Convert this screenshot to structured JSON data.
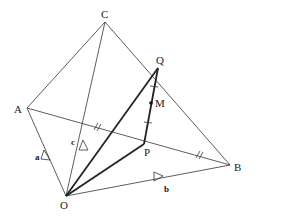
{
  "diagram": {
    "type": "vector geometry tetrahedron",
    "points": {
      "O": {
        "label": "O",
        "x": 66,
        "y": 196
      },
      "A": {
        "label": "A",
        "x": 27,
        "y": 108
      },
      "B": {
        "label": "B",
        "x": 230,
        "y": 165
      },
      "C": {
        "label": "C",
        "x": 105,
        "y": 22
      },
      "P": {
        "label": "P",
        "x": 144,
        "y": 144
      },
      "Q": {
        "label": "Q",
        "x": 158,
        "y": 68
      },
      "M": {
        "label": "M",
        "x": 151,
        "y": 103
      }
    },
    "vectors": {
      "a": {
        "label": "a",
        "from": "O",
        "to": "A"
      },
      "b": {
        "label": "b",
        "from": "O",
        "to": "B"
      },
      "c": {
        "label": "c",
        "from": "O",
        "to": "C"
      }
    },
    "edges_thin": [
      "OA",
      "OB",
      "OC",
      "AC",
      "CB",
      "AB"
    ],
    "edges_thick": [
      "OP",
      "OQ",
      "PQ"
    ],
    "equal_marks": {
      "AB_midpoint": "double tick",
      "PQ_halves": "single tick"
    }
  }
}
